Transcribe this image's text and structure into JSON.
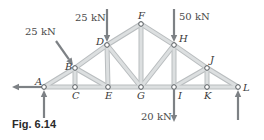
{
  "figure": {
    "caption": "Fig. 6.14",
    "type": "truss"
  },
  "nodes": [
    {
      "id": "A",
      "x": 44,
      "y": 87,
      "label_dx": -9,
      "label_dy": -2
    },
    {
      "id": "B",
      "x": 75,
      "y": 68,
      "label_dx": -10,
      "label_dy": 2
    },
    {
      "id": "C",
      "x": 75,
      "y": 87,
      "label_dx": -3,
      "label_dy": 12
    },
    {
      "id": "D",
      "x": 107,
      "y": 45,
      "label_dx": -11,
      "label_dy": 0
    },
    {
      "id": "E",
      "x": 108,
      "y": 87,
      "label_dx": -3,
      "label_dy": 12
    },
    {
      "id": "F",
      "x": 141,
      "y": 24,
      "label_dx": -3,
      "label_dy": -5
    },
    {
      "id": "G",
      "x": 141,
      "y": 87,
      "label_dx": -4,
      "label_dy": 12
    },
    {
      "id": "H",
      "x": 174,
      "y": 45,
      "label_dx": 5,
      "label_dy": -3
    },
    {
      "id": "I",
      "x": 174,
      "y": 87,
      "label_dx": 4,
      "label_dy": 12
    },
    {
      "id": "J",
      "x": 207,
      "y": 68,
      "label_dx": 3,
      "label_dy": -5
    },
    {
      "id": "K",
      "x": 207,
      "y": 87,
      "label_dx": -3,
      "label_dy": 12
    },
    {
      "id": "L",
      "x": 238,
      "y": 87,
      "label_dx": 5,
      "label_dy": 4
    }
  ],
  "members": [
    [
      "A",
      "B"
    ],
    [
      "B",
      "D"
    ],
    [
      "D",
      "F"
    ],
    [
      "F",
      "H"
    ],
    [
      "H",
      "J"
    ],
    [
      "J",
      "L"
    ],
    [
      "A",
      "C"
    ],
    [
      "C",
      "E"
    ],
    [
      "E",
      "G"
    ],
    [
      "G",
      "I"
    ],
    [
      "I",
      "K"
    ],
    [
      "K",
      "L"
    ],
    [
      "B",
      "C"
    ],
    [
      "B",
      "E"
    ],
    [
      "D",
      "E"
    ],
    [
      "D",
      "G"
    ],
    [
      "F",
      "G"
    ],
    [
      "H",
      "G"
    ],
    [
      "H",
      "I"
    ],
    [
      "J",
      "I"
    ],
    [
      "J",
      "K"
    ]
  ],
  "loads": [
    {
      "node": "B",
      "label": "25 kN",
      "x1": 56,
      "y1": 41,
      "x2": 73,
      "y2": 65,
      "label_x": 25,
      "label_y": 35
    },
    {
      "node": "D",
      "label": "25 kN",
      "x1": 107,
      "y1": 9,
      "x2": 107,
      "y2": 42,
      "label_x": 75,
      "label_y": 21
    },
    {
      "node": "H",
      "label": "50 kN",
      "x1": 174,
      "y1": 9,
      "x2": 174,
      "y2": 42,
      "label_x": 179,
      "label_y": 20
    },
    {
      "node": "I",
      "label": "20 kN",
      "x1": 174,
      "y1": 90,
      "x2": 174,
      "y2": 122,
      "label_x": 141,
      "label_y": 120
    }
  ],
  "reactions": [
    {
      "node": "A",
      "direction": "left",
      "x1": 42,
      "y1": 87,
      "x2": 12,
      "y2": 87
    },
    {
      "node": "A",
      "direction": "up",
      "x1": 44,
      "y1": 118,
      "x2": 44,
      "y2": 90
    },
    {
      "node": "L",
      "direction": "up",
      "x1": 238,
      "y1": 120,
      "x2": 238,
      "y2": 90
    }
  ],
  "colors": {
    "member": "#dcdfe0",
    "member_edge": "#b9bdbf",
    "arrow": "#7d8185",
    "text": "#3a3a3a"
  }
}
